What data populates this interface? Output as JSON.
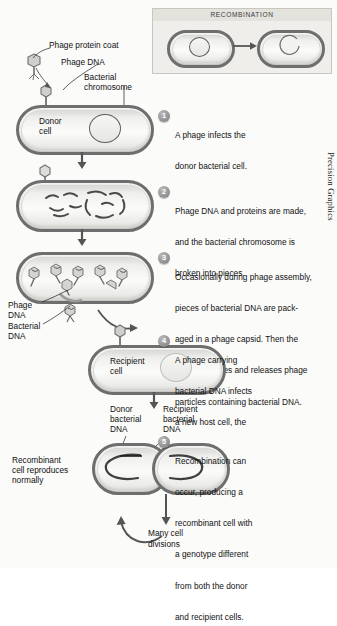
{
  "figure": {
    "credit": "Precision Graphics"
  },
  "inset": {
    "title": "RECOMBINATION",
    "left_cell_name": "bacterial-cell-before",
    "right_cell_name": "bacterial-cell-after"
  },
  "labels": {
    "phage_protein_coat": "Phage protein coat",
    "phage_dna": "Phage DNA",
    "bacterial_chromosome_l1": "Bacterial",
    "bacterial_chromosome_l2": "chromosome",
    "donor_cell_l1": "Donor",
    "donor_cell_l2": "cell",
    "phage_dna_l1": "Phage",
    "phage_dna_l2": "DNA",
    "bacterial_dna_l1": "Bacterial",
    "bacterial_dna_l2": "DNA",
    "recipient_cell_l1": "Recipient",
    "recipient_cell_l2": "cell",
    "donor_bacterial_dna_l1": "Donor",
    "donor_bacterial_dna_l2": "bacterial",
    "donor_bacterial_dna_l3": "DNA",
    "recipient_bacterial_dna_l1": "Recipient",
    "recipient_bacterial_dna_l2": "bacterial",
    "recipient_bacterial_dna_l3": "DNA",
    "recombinant_l1": "Recombinant",
    "recombinant_l2": "cell reproduces",
    "recombinant_l3": "normally",
    "many_cell_divisions_l1": "Many cell",
    "many_cell_divisions_l2": "divisions"
  },
  "steps": [
    {
      "number": "1",
      "lines": [
        "A phage infects the",
        "donor bacterial cell."
      ]
    },
    {
      "number": "2",
      "lines": [
        "Phage DNA and proteins are made,",
        "and the bacterial chromosome is",
        "broken into pieces."
      ]
    },
    {
      "number": "3",
      "lines": [
        "Occasionally during phage assembly,",
        "pieces of bacterial DNA are pack-",
        "aged in a phage capsid. Then the",
        "donor cell lyses and releases phage",
        "particles containing bacterial DNA."
      ]
    },
    {
      "number": "4",
      "lines": [
        "A phage carrying",
        "bacterial DNA infects",
        "a new host cell, the",
        "recipient cell."
      ]
    },
    {
      "number": "5",
      "lines": [
        "Recombination can",
        "occur, producing a",
        "recombinant cell with",
        "a genotype different",
        "from both the donor",
        "and recipient cells."
      ]
    }
  ],
  "colors": {
    "cell_outline": "#6e6e6e",
    "inset_background": "#e4e2dd",
    "badge": "#8e8e8e",
    "arrow": "#555555",
    "text": "#111111"
  }
}
